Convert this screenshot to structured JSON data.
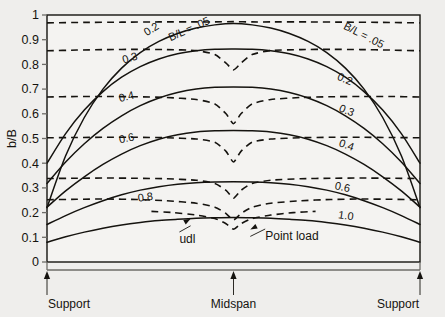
{
  "chart_data": {
    "type": "line",
    "title": "",
    "xlabel": "",
    "ylabel": "b/B",
    "ylim": [
      0,
      1
    ],
    "xlim": [
      0,
      1
    ],
    "grid": false,
    "legend": "none",
    "yticks": [
      "0",
      "0.1",
      "0.2",
      "0.3",
      "0.4",
      "0.5",
      "0.6",
      "0.7",
      "0.8",
      "0.9",
      "1"
    ],
    "ytickvals": [
      0,
      0.1,
      0.2,
      0.3,
      0.4,
      0.5,
      0.6,
      0.7,
      0.8,
      0.9,
      1.0
    ],
    "xtick_captions": [
      "Support",
      "Midspan",
      "Support"
    ],
    "xtickvals": [
      0,
      0.5,
      1.0
    ],
    "annotations": [
      {
        "name": "udl",
        "text": "udl",
        "x": 0.38,
        "y": 0.175
      },
      {
        "name": "point-load",
        "text": "Point load",
        "x": 0.55,
        "y": 0.135
      }
    ],
    "series": [
      {
        "name": "udl B/L = .05",
        "style": "solid",
        "label": "B/L = .05",
        "label_left": "",
        "label_right": "B/L = .05",
        "x": [
          0.0,
          0.05,
          0.1,
          0.15,
          0.2,
          0.25,
          0.3,
          0.35,
          0.4,
          0.45,
          0.5,
          0.55,
          0.6,
          0.65,
          0.7,
          0.75,
          0.8,
          0.85,
          0.9,
          0.95,
          1.0
        ],
        "values": [
          0.22,
          0.43,
          0.585,
          0.7,
          0.785,
          0.848,
          0.893,
          0.925,
          0.947,
          0.96,
          0.966,
          0.96,
          0.947,
          0.925,
          0.893,
          0.848,
          0.785,
          0.7,
          0.585,
          0.43,
          0.22
        ]
      },
      {
        "name": "udl B/L = 0.2",
        "style": "solid",
        "label": "0.2",
        "label_left": "",
        "label_right": "0.2",
        "x": [
          0.0,
          0.05,
          0.1,
          0.15,
          0.2,
          0.25,
          0.3,
          0.35,
          0.4,
          0.45,
          0.5,
          0.55,
          0.6,
          0.65,
          0.7,
          0.75,
          0.8,
          0.85,
          0.9,
          0.95,
          1.0
        ],
        "values": [
          0.4,
          0.52,
          0.615,
          0.69,
          0.748,
          0.791,
          0.822,
          0.843,
          0.855,
          0.861,
          0.862,
          0.861,
          0.855,
          0.843,
          0.822,
          0.791,
          0.748,
          0.69,
          0.615,
          0.52,
          0.4
        ]
      },
      {
        "name": "udl B/L = 0.3",
        "style": "solid",
        "label": "0.3",
        "label_left": "",
        "label_right": "0.3",
        "x": [
          0.0,
          0.05,
          0.1,
          0.15,
          0.2,
          0.25,
          0.3,
          0.35,
          0.4,
          0.45,
          0.5,
          0.55,
          0.6,
          0.65,
          0.7,
          0.75,
          0.8,
          0.85,
          0.9,
          0.95,
          1.0
        ],
        "values": [
          0.318,
          0.405,
          0.479,
          0.541,
          0.592,
          0.633,
          0.664,
          0.686,
          0.7,
          0.707,
          0.709,
          0.707,
          0.7,
          0.686,
          0.664,
          0.633,
          0.592,
          0.541,
          0.479,
          0.405,
          0.318
        ]
      },
      {
        "name": "udl B/L = 0.4",
        "style": "solid",
        "label": "0.4",
        "label_left": "",
        "label_right": "0.4",
        "x": [
          0.0,
          0.05,
          0.1,
          0.15,
          0.2,
          0.25,
          0.3,
          0.35,
          0.4,
          0.45,
          0.5,
          0.55,
          0.6,
          0.65,
          0.7,
          0.75,
          0.8,
          0.85,
          0.9,
          0.95,
          1.0
        ],
        "values": [
          0.222,
          0.288,
          0.345,
          0.395,
          0.437,
          0.471,
          0.497,
          0.515,
          0.526,
          0.531,
          0.532,
          0.531,
          0.526,
          0.515,
          0.497,
          0.471,
          0.437,
          0.395,
          0.345,
          0.288,
          0.222
        ]
      },
      {
        "name": "udl B/L = 0.6",
        "style": "solid",
        "label": "0.6",
        "label_left": "",
        "label_right": "0.6",
        "x": [
          0.0,
          0.05,
          0.1,
          0.15,
          0.2,
          0.25,
          0.3,
          0.35,
          0.4,
          0.45,
          0.5,
          0.55,
          0.6,
          0.65,
          0.7,
          0.75,
          0.8,
          0.85,
          0.9,
          0.95,
          1.0
        ],
        "values": [
          0.152,
          0.188,
          0.22,
          0.248,
          0.272,
          0.291,
          0.305,
          0.315,
          0.321,
          0.324,
          0.325,
          0.324,
          0.321,
          0.315,
          0.305,
          0.291,
          0.272,
          0.248,
          0.22,
          0.188,
          0.152
        ]
      },
      {
        "name": "udl B/L = 1.0",
        "style": "solid",
        "label": "1.0",
        "label_left": "",
        "label_right": "1.0",
        "x": [
          0.0,
          0.05,
          0.1,
          0.15,
          0.2,
          0.25,
          0.3,
          0.35,
          0.4,
          0.45,
          0.5,
          0.55,
          0.6,
          0.65,
          0.7,
          0.75,
          0.8,
          0.85,
          0.9,
          0.95,
          1.0
        ],
        "values": [
          0.08,
          0.102,
          0.121,
          0.137,
          0.15,
          0.16,
          0.168,
          0.173,
          0.177,
          0.179,
          0.18,
          0.179,
          0.177,
          0.173,
          0.168,
          0.16,
          0.15,
          0.137,
          0.121,
          0.102,
          0.08
        ]
      },
      {
        "name": "point-load B/L = .05",
        "style": "dashed",
        "label": "B/L = .05",
        "label_left": "B/L = .05",
        "label_right": "",
        "x": [
          0.0,
          0.1,
          0.2,
          0.3,
          0.4,
          0.45,
          0.5,
          0.55,
          0.6,
          0.7,
          0.8,
          0.9,
          1.0
        ],
        "values": [
          0.968,
          0.97,
          0.971,
          0.972,
          0.972,
          0.972,
          0.973,
          0.972,
          0.972,
          0.972,
          0.971,
          0.97,
          0.968
        ]
      },
      {
        "name": "point-load B/L = 0.2",
        "style": "dashed",
        "label": "0.2",
        "label_left": "0.2",
        "label_right": "",
        "x": [
          0.0,
          0.08,
          0.16,
          0.24,
          0.32,
          0.4,
          0.45,
          0.48,
          0.5,
          0.52,
          0.55,
          0.6,
          0.68,
          0.76,
          0.84,
          0.92,
          1.0
        ],
        "values": [
          0.855,
          0.858,
          0.86,
          0.861,
          0.86,
          0.856,
          0.84,
          0.805,
          0.778,
          0.805,
          0.84,
          0.856,
          0.86,
          0.861,
          0.86,
          0.858,
          0.855
        ]
      },
      {
        "name": "point-load B/L = 0.3",
        "style": "dashed",
        "label": "0.3",
        "label_left": "0.3",
        "label_right": "",
        "x": [
          0.0,
          0.08,
          0.16,
          0.24,
          0.32,
          0.4,
          0.45,
          0.48,
          0.5,
          0.52,
          0.55,
          0.6,
          0.68,
          0.76,
          0.84,
          0.92,
          1.0
        ],
        "values": [
          0.668,
          0.67,
          0.67,
          0.669,
          0.666,
          0.658,
          0.64,
          0.6,
          0.56,
          0.6,
          0.64,
          0.658,
          0.666,
          0.669,
          0.67,
          0.67,
          0.668
        ]
      },
      {
        "name": "point-load B/L = 0.4",
        "style": "dashed",
        "label": "0.4",
        "label_left": "0.4",
        "label_right": "",
        "x": [
          0.0,
          0.08,
          0.16,
          0.24,
          0.32,
          0.4,
          0.45,
          0.48,
          0.5,
          0.52,
          0.55,
          0.6,
          0.68,
          0.76,
          0.84,
          0.92,
          1.0
        ],
        "values": [
          0.503,
          0.504,
          0.505,
          0.505,
          0.503,
          0.498,
          0.485,
          0.448,
          0.405,
          0.448,
          0.485,
          0.498,
          0.503,
          0.505,
          0.505,
          0.504,
          0.503
        ]
      },
      {
        "name": "point-load B/L = 0.6",
        "style": "dashed",
        "label": "0.6",
        "label_left": "0.6",
        "label_right": "",
        "x": [
          0.0,
          0.08,
          0.16,
          0.24,
          0.32,
          0.4,
          0.45,
          0.48,
          0.5,
          0.52,
          0.55,
          0.6,
          0.68,
          0.76,
          0.84,
          0.92,
          1.0
        ],
        "values": [
          0.338,
          0.339,
          0.34,
          0.339,
          0.337,
          0.331,
          0.318,
          0.29,
          0.258,
          0.29,
          0.318,
          0.331,
          0.337,
          0.339,
          0.34,
          0.339,
          0.338
        ]
      },
      {
        "name": "point-load B/L = 0.8",
        "style": "dashed",
        "label": "0.8",
        "label_left": "0.8",
        "label_right": "",
        "x": [
          0.0,
          0.08,
          0.16,
          0.24,
          0.32,
          0.4,
          0.45,
          0.48,
          0.5,
          0.52,
          0.55,
          0.6,
          0.68,
          0.76,
          0.84,
          0.92,
          1.0
        ],
        "values": [
          0.252,
          0.254,
          0.255,
          0.253,
          0.248,
          0.238,
          0.222,
          0.196,
          0.17,
          0.196,
          0.222,
          0.238,
          0.248,
          0.253,
          0.255,
          0.254,
          0.252
        ]
      },
      {
        "name": "point-load B/L = 1.0",
        "style": "dashed",
        "label": "1.0",
        "label_left": "",
        "label_right": "",
        "x": [
          0.28,
          0.34,
          0.4,
          0.45,
          0.48,
          0.5,
          0.52,
          0.55,
          0.6,
          0.66,
          0.72
        ],
        "values": [
          0.205,
          0.2,
          0.19,
          0.176,
          0.155,
          0.133,
          0.155,
          0.176,
          0.19,
          0.2,
          0.205
        ]
      }
    ],
    "curve_labels": [
      {
        "name": "label-dash-02-left",
        "text": "0.2",
        "x": 0.285,
        "y": 0.93,
        "rot": -32
      },
      {
        "name": "label-dash-bl05-left",
        "text": "B/L = .05",
        "x": 0.385,
        "y": 0.93,
        "rot": -24
      },
      {
        "name": "label-dash-03-left",
        "text": "0.3",
        "x": 0.225,
        "y": 0.812,
        "rot": -16
      },
      {
        "name": "label-dash-04-left",
        "text": "0.4",
        "x": 0.215,
        "y": 0.655,
        "rot": -13
      },
      {
        "name": "label-dash-06-left",
        "text": "0.6",
        "x": 0.215,
        "y": 0.487,
        "rot": -11
      },
      {
        "name": "label-dash-08-left",
        "text": "0.8",
        "x": 0.265,
        "y": 0.248,
        "rot": -7
      },
      {
        "name": "label-solid-bl05-right",
        "text": "B/L = .05",
        "x": 0.845,
        "y": 0.905,
        "rot": 27
      },
      {
        "name": "label-solid-02-right",
        "text": "0.2",
        "x": 0.795,
        "y": 0.727,
        "rot": 24
      },
      {
        "name": "label-solid-03-right",
        "text": "0.3",
        "x": 0.8,
        "y": 0.6,
        "rot": 22
      },
      {
        "name": "label-solid-04-right",
        "text": "0.4",
        "x": 0.8,
        "y": 0.46,
        "rot": 19
      },
      {
        "name": "label-solid-06-right",
        "text": "0.6",
        "x": 0.79,
        "y": 0.289,
        "rot": 12
      },
      {
        "name": "label-solid-10-right",
        "text": "1.0",
        "x": 0.8,
        "y": 0.173,
        "rot": 8
      }
    ]
  }
}
